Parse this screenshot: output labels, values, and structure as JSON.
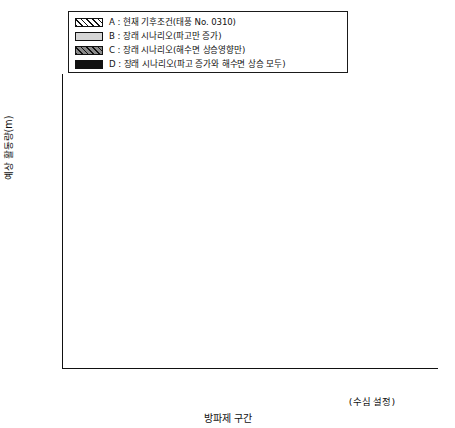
{
  "legend": {
    "items": [
      {
        "key": "A",
        "label": "A : 현재 기후조건(태풍  No. 0310)",
        "swatch": "hatch-white-swatch"
      },
      {
        "key": "B",
        "label": "B : 장래 시나리오(파고만 증가)",
        "swatch": "light-gray-swatch"
      },
      {
        "key": "C",
        "label": "C : 장래 시나리오(해수면 상승영향만)",
        "swatch": "hatch-dark-gray-swatch"
      },
      {
        "key": "D",
        "label": "D : 장래 시나리오(파고 증가와 해수면 상승 모두)",
        "swatch": "black-swatch"
      }
    ]
  },
  "axes": {
    "y_title": "예상 활동량(m)",
    "y_ticks": [
      "0.00",
      "0.02",
      "0.04",
      "0.06",
      "0.08",
      "0.10",
      "0.12",
      "0.14",
      "0.16",
      "0.18",
      "0.20"
    ],
    "x_title": "방파제 구간",
    "x_note": "(수심 설정)"
  },
  "chart_data": {
    "type": "bar",
    "title": "",
    "xlabel": "방파제 구간",
    "ylabel": "예상 활동량(m)",
    "ylim": [
      0.0,
      0.2
    ],
    "ytick_step": 0.02,
    "grid": false,
    "legend_position": "top-center",
    "categories": [
      "II",
      "III",
      "IV",
      "V",
      "VI",
      "VII"
    ],
    "category_depths": [
      "(11.5m)",
      "(11.5m)",
      "(12.4m)",
      "(13.2m)",
      "(13.2m)",
      "(15.0m)"
    ],
    "series": [
      {
        "name": "A : 현재 기후조건(태풍  No. 0310)",
        "values": [
          0.05,
          0.035,
          0.041,
          0.034,
          0.012,
          0.025
        ],
        "labels": [
          "100%",
          "100%",
          "100%",
          "100%",
          "100%",
          "100%"
        ]
      },
      {
        "name": "B : 장래 시나리오(파고만 증가)",
        "values": [
          0.095,
          0.065,
          0.081,
          0.078,
          0.028,
          0.091
        ],
        "labels": [
          "188%",
          "189%",
          "196%",
          "231%",
          "229%",
          "364%"
        ]
      },
      {
        "name": "C : 장래 시나리오(해수면 상승영향만)",
        "values": [
          0.095,
          0.067,
          0.07,
          0.052,
          0.02,
          0.031
        ],
        "labels": [
          "188%",
          "194%",
          "169%",
          "154%",
          "164%",
          "124%"
        ]
      },
      {
        "name": "D : 장래 시나리오(파고 증가와 해수면 상승 모두)",
        "values": [
          0.18,
          0.128,
          0.15,
          0.131,
          0.05,
          0.132
        ],
        "labels": [
          "357%",
          "370%",
          "366%",
          "389%",
          "407%",
          "527%"
        ]
      }
    ]
  }
}
